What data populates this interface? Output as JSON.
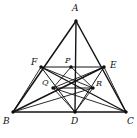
{
  "figure": {
    "canvas": {
      "width": 137,
      "height": 138
    },
    "stroke_color": "#141414",
    "background_color": "#ffffff",
    "label_color": "#111111"
  },
  "points": [
    {
      "id": "A",
      "label": "A",
      "x": 76,
      "y": 21,
      "label_x": 72,
      "label_y": 4,
      "dot": true
    },
    {
      "id": "B",
      "label": "B",
      "x": 13,
      "y": 112,
      "label_x": 3,
      "label_y": 117,
      "dot": true
    },
    {
      "id": "C",
      "label": "C",
      "x": 126,
      "y": 112,
      "label_x": 127,
      "label_y": 117,
      "dot": true
    },
    {
      "id": "D",
      "label": "D",
      "x": 75,
      "y": 112,
      "label_x": 71,
      "label_y": 117,
      "dot": true
    },
    {
      "id": "E",
      "label": "E",
      "x": 104,
      "y": 67,
      "label_x": 110,
      "label_y": 61,
      "dot": true
    },
    {
      "id": "F",
      "label": "F",
      "x": 41,
      "y": 67,
      "label_x": 31,
      "label_y": 58,
      "dot": true
    },
    {
      "id": "P",
      "label": "P",
      "x": 71,
      "y": 67,
      "label_x": 65,
      "label_y": 57,
      "dot": true
    },
    {
      "id": "Q",
      "label": "Q",
      "x": 53,
      "y": 88,
      "label_x": 42,
      "label_y": 79,
      "dot": true
    },
    {
      "id": "R",
      "label": "R",
      "x": 93,
      "y": 88,
      "label_x": 96,
      "label_y": 80,
      "dot": true
    }
  ],
  "segments": [
    {
      "from": "A",
      "to": "B",
      "kind": "main"
    },
    {
      "from": "A",
      "to": "C",
      "kind": "main"
    },
    {
      "from": "B",
      "to": "C",
      "kind": "main"
    },
    {
      "from": "A",
      "to": "D",
      "kind": "median"
    },
    {
      "from": "B",
      "to": "E",
      "kind": "median"
    },
    {
      "from": "C",
      "to": "F",
      "kind": "median"
    },
    {
      "from": "F",
      "to": "E",
      "kind": "inner"
    },
    {
      "from": "Q",
      "to": "R",
      "kind": "inner"
    },
    {
      "from": "F",
      "to": "D",
      "kind": "inner"
    },
    {
      "from": "E",
      "to": "D",
      "kind": "inner"
    },
    {
      "from": "F",
      "to": "R",
      "kind": "thin"
    },
    {
      "from": "E",
      "to": "Q",
      "kind": "thin"
    },
    {
      "from": "B",
      "to": "R",
      "kind": "thin"
    },
    {
      "from": "C",
      "to": "Q",
      "kind": "thin"
    },
    {
      "from": "P",
      "to": "Q",
      "kind": "thin"
    },
    {
      "from": "P",
      "to": "R",
      "kind": "thin"
    },
    {
      "from": "Q",
      "to": "D",
      "kind": "thin"
    },
    {
      "from": "R",
      "to": "D",
      "kind": "thin"
    },
    {
      "from": "B",
      "to": "F",
      "kind": "thin"
    },
    {
      "from": "C",
      "to": "E",
      "kind": "thin"
    }
  ]
}
